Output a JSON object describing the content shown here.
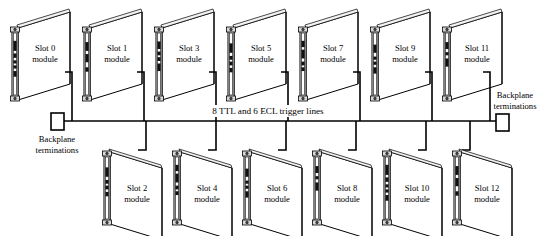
{
  "diagram": {
    "background_color": "#ffffff",
    "line_color": "#000000",
    "panel_fill": "#ffffff",
    "board_fill": "#ffffff",
    "connector_color": "#111111",
    "bus": {
      "label": "8 TTL and 6 ECL trigger lines",
      "label_x": 268,
      "label_y": 114,
      "y": 121,
      "x_start": 62,
      "x_end": 498
    },
    "terminations": [
      {
        "name": "left-backplane-termination",
        "line1": "Backplane",
        "line2": "terminations",
        "box_x": 51,
        "box_y": 113,
        "box_w": 13,
        "box_h": 17,
        "label_x": 57,
        "label_y": 142
      },
      {
        "name": "right-backplane-termination",
        "line1": "Backplane",
        "line2": "terminations",
        "box_x": 496,
        "box_y": 114,
        "box_w": 13,
        "box_h": 17,
        "label_x": 515,
        "label_y": 98
      }
    ],
    "top_modules": [
      {
        "slot": "Slot 0",
        "line2": "module",
        "x": 12,
        "stub_x": 72
      },
      {
        "slot": "Slot 1",
        "line2": "module",
        "x": 84,
        "stub_x": 144
      },
      {
        "slot": "Slot 3",
        "line2": "module",
        "x": 156,
        "stub_x": 216
      },
      {
        "slot": "Slot 5",
        "line2": "module",
        "x": 228,
        "stub_x": 288
      },
      {
        "slot": "Slot 7",
        "line2": "module",
        "x": 300,
        "stub_x": 360
      },
      {
        "slot": "Slot 9",
        "line2": "module",
        "x": 372,
        "stub_x": 432
      },
      {
        "slot": "Slot 11",
        "line2": "module",
        "x": 444,
        "stub_x": 490
      }
    ],
    "bottom_modules": [
      {
        "slot": "Slot 2",
        "line2": "module",
        "x": 104,
        "stub_x": 146
      },
      {
        "slot": "Slot 4",
        "line2": "module",
        "x": 174,
        "stub_x": 216
      },
      {
        "slot": "Slot 6",
        "line2": "module",
        "x": 244,
        "stub_x": 286
      },
      {
        "slot": "Slot 8",
        "line2": "module",
        "x": 314,
        "stub_x": 356
      },
      {
        "slot": "Slot 10",
        "line2": "module",
        "x": 384,
        "stub_x": 426
      },
      {
        "slot": "Slot 12",
        "line2": "module",
        "x": 454,
        "stub_x": 470
      }
    ]
  }
}
